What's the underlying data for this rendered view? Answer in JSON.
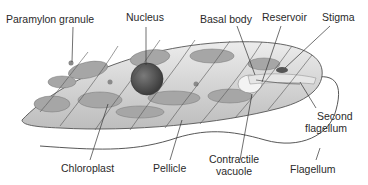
{
  "diagram": {
    "colors": {
      "body_fill": "#d8d8d8",
      "organelle": "#a8a8a8",
      "nucleus": "#5a5a5a",
      "line": "#333333",
      "text": "#2a2a2a"
    },
    "labels": {
      "paramylon_granule": "Paramylon granule",
      "nucleus": "Nucleus",
      "basal_body": "Basal body",
      "reservoir": "Reservoir",
      "stigma": "Stigma",
      "second_flagellum_1": "Second",
      "second_flagellum_2": "flagellum",
      "chloroplast": "Chloroplast",
      "pellicle": "Pellicle",
      "contractile_vacuole_1": "Contractile",
      "contractile_vacuole_2": "vacuole",
      "flagellum": "Flagellum"
    }
  }
}
